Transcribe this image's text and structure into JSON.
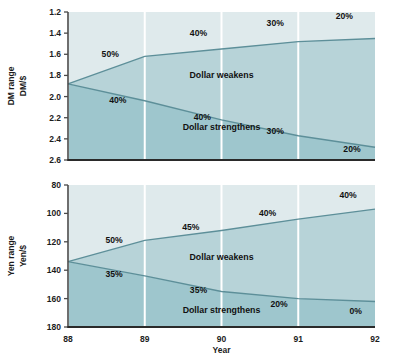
{
  "figure": {
    "background_color": "#ffffff",
    "band_outer_color": "#dfeaec",
    "band_upper_color": "#b7d3d8",
    "band_lower_color": "#9ec6cd",
    "curve_color": "#5d8f99",
    "gridline_color": "#ffffff",
    "axis_color": "#4a4a4a"
  },
  "xaxis": {
    "label": "Year",
    "ticks": [
      "88",
      "89",
      "90",
      "91",
      "92"
    ],
    "values": [
      88,
      89,
      90,
      91,
      92
    ]
  },
  "chart_data": [
    {
      "type": "area",
      "id": "dm-chart",
      "title": "",
      "ylabel_line1": "DM range",
      "ylabel_line2": "DM/$",
      "xlabel": "Year",
      "x": [
        88,
        89,
        90,
        91,
        92
      ],
      "ticks": [
        "1.2",
        "1.4",
        "1.6",
        "1.8",
        "2.0",
        "2.2",
        "2.4",
        "2.6"
      ],
      "tickvalues": [
        1.2,
        1.4,
        1.6,
        1.8,
        2.0,
        2.2,
        2.4,
        2.6
      ],
      "ylim": [
        1.2,
        2.6
      ],
      "y_inverted": true,
      "grid": true,
      "series": [
        {
          "name": "Dollar weakens (upper bound)",
          "values": [
            1.88,
            1.62,
            1.55,
            1.48,
            1.45
          ]
        },
        {
          "name": "Dollar strengthens (lower bound)",
          "values": [
            1.88,
            2.04,
            2.22,
            2.37,
            2.48
          ]
        }
      ],
      "region_labels": [
        {
          "text": "Dollar weakens",
          "x": 90,
          "y": 1.82
        },
        {
          "text": "Dollar strengthens",
          "x": 90,
          "y": 2.32
        }
      ],
      "annotations_upper": [
        {
          "text": "50%",
          "x": 88.55,
          "y": 1.63
        },
        {
          "text": "40%",
          "x": 89.7,
          "y": 1.43
        },
        {
          "text": "30%",
          "x": 90.7,
          "y": 1.33
        },
        {
          "text": "20%",
          "x": 91.6,
          "y": 1.27
        }
      ],
      "annotations_lower": [
        {
          "text": "40%",
          "x": 88.65,
          "y": 2.06
        },
        {
          "text": "40%",
          "x": 89.75,
          "y": 2.22
        },
        {
          "text": "30%",
          "x": 90.7,
          "y": 2.35
        },
        {
          "text": "20%",
          "x": 91.7,
          "y": 2.52
        }
      ]
    },
    {
      "type": "area",
      "id": "yen-chart",
      "title": "",
      "ylabel_line1": "Yen range",
      "ylabel_line2": "Yen/$",
      "xlabel": "Year",
      "x": [
        88,
        89,
        90,
        91,
        92
      ],
      "ticks": [
        "80",
        "100",
        "120",
        "140",
        "160",
        "180"
      ],
      "tickvalues": [
        80,
        100,
        120,
        140,
        160,
        180
      ],
      "ylim": [
        80,
        180
      ],
      "y_inverted": true,
      "grid": true,
      "series": [
        {
          "name": "Dollar weakens (upper bound)",
          "values": [
            134,
            119,
            112,
            104,
            97
          ]
        },
        {
          "name": "Dollar strengthens (lower bound)",
          "values": [
            134,
            144,
            155,
            160,
            162
          ]
        }
      ],
      "region_labels": [
        {
          "text": "Dollar weakens",
          "x": 90,
          "y": 133
        },
        {
          "text": "Dollar strengthens",
          "x": 90,
          "y": 170
        }
      ],
      "annotations_upper": [
        {
          "text": "50%",
          "x": 88.6,
          "y": 121
        },
        {
          "text": "45%",
          "x": 89.6,
          "y": 112
        },
        {
          "text": "40%",
          "x": 90.6,
          "y": 102
        },
        {
          "text": "40%",
          "x": 91.65,
          "y": 89
        }
      ],
      "annotations_lower": [
        {
          "text": "35%",
          "x": 88.6,
          "y": 145
        },
        {
          "text": "35%",
          "x": 89.7,
          "y": 156
        },
        {
          "text": "20%",
          "x": 90.75,
          "y": 166
        },
        {
          "text": "0%",
          "x": 91.75,
          "y": 171
        }
      ]
    }
  ]
}
